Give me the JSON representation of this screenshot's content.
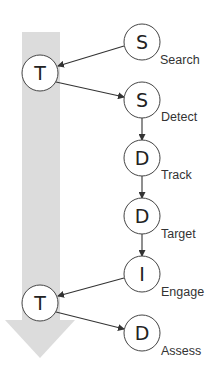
{
  "diagram": {
    "time_arrow": {
      "color": "#dcdcdc"
    },
    "nodes": [
      {
        "id": "search",
        "letter": "S",
        "label": "Search",
        "cx": 142,
        "cy": 42
      },
      {
        "id": "t1",
        "letter": "T",
        "label": "",
        "cx": 40,
        "cy": 73
      },
      {
        "id": "detect",
        "letter": "S",
        "label": "Detect",
        "cx": 142,
        "cy": 100
      },
      {
        "id": "track",
        "letter": "D",
        "label": "Track",
        "cx": 142,
        "cy": 158
      },
      {
        "id": "target",
        "letter": "D",
        "label": "Target",
        "cx": 142,
        "cy": 216
      },
      {
        "id": "engage",
        "letter": "I",
        "label": "Engage",
        "cx": 142,
        "cy": 274
      },
      {
        "id": "t2",
        "letter": "T",
        "label": "",
        "cx": 40,
        "cy": 303
      },
      {
        "id": "assess",
        "letter": "D",
        "label": "Assess",
        "cx": 142,
        "cy": 333
      }
    ],
    "edges": [
      {
        "from": "search",
        "to": "t1"
      },
      {
        "from": "t1",
        "to": "detect"
      },
      {
        "from": "detect",
        "to": "track"
      },
      {
        "from": "track",
        "to": "target"
      },
      {
        "from": "target",
        "to": "engage"
      },
      {
        "from": "engage",
        "to": "t2"
      },
      {
        "from": "t2",
        "to": "assess"
      }
    ]
  }
}
